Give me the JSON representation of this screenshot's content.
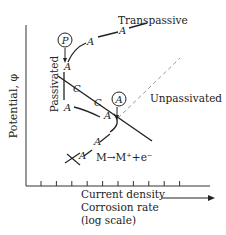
{
  "diagram": {
    "axes": {
      "y_label": "Potential, φ",
      "x_label_lines": [
        "Current density",
        "Corrosion rate",
        "(log scale)"
      ],
      "x_tick_count": 10,
      "x_arrow": "increasing-right-arrow"
    },
    "region_labels": {
      "transpassive": "Transpassive",
      "passivated": "Passivated",
      "unpassivated": "Unpassivated"
    },
    "reaction": "M→M⁺+e⁻",
    "markers": {
      "anodic": "A",
      "cathodic": "C",
      "passive_point": "P",
      "active_point": "A"
    },
    "curves": [
      {
        "name": "anodic-polarization-curve",
        "style": "solid",
        "labels": [
          "A",
          "A",
          "A",
          "A",
          "A",
          "A",
          "A"
        ]
      },
      {
        "name": "cathodic-reduction-line",
        "style": "solid",
        "labels": [
          "C",
          "C"
        ]
      },
      {
        "name": "unpassivated-extension",
        "style": "dashed"
      }
    ],
    "colors": {
      "ink": "#222222",
      "dashed": "#999999",
      "background": "#ffffff"
    }
  }
}
